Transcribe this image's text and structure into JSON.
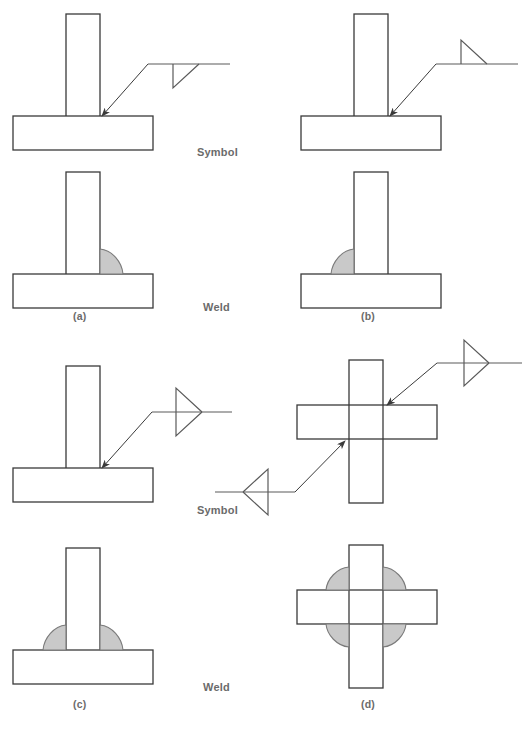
{
  "figure": {
    "colors": {
      "line": "#3a3a3a",
      "symbol_line": "#5a5a5a",
      "weld_fill": "#c9c9c9",
      "weld_stroke": "#7a7a7a",
      "label_text": "#6b6b6b",
      "background": "#ffffff"
    },
    "row_labels": [
      {
        "id": "symbol-top",
        "text": "Symbol"
      },
      {
        "id": "weld-top",
        "text": "Weld"
      },
      {
        "id": "symbol-bottom",
        "text": "Symbol"
      },
      {
        "id": "weld-bottom",
        "text": "Weld"
      }
    ],
    "panels": [
      {
        "id": "a",
        "letter": "(a)",
        "joint": "tee-joint",
        "symbol": {
          "type": "fillet",
          "triangle_position": "below-reference-line",
          "meaning": "arrow side",
          "triangle_count": 1
        },
        "weld": {
          "count": 1,
          "sides": [
            "right"
          ],
          "description": "single fillet weld on arrow side"
        }
      },
      {
        "id": "b",
        "letter": "(b)",
        "joint": "tee-joint",
        "symbol": {
          "type": "fillet",
          "triangle_position": "above-reference-line",
          "meaning": "other side",
          "triangle_count": 1
        },
        "weld": {
          "count": 1,
          "sides": [
            "left"
          ],
          "description": "single fillet weld on other side"
        }
      },
      {
        "id": "c",
        "letter": "(c)",
        "joint": "tee-joint",
        "symbol": {
          "type": "double-fillet",
          "triangle_position": "both-sides-of-reference-line",
          "meaning": "both sides",
          "triangle_count": 2
        },
        "weld": {
          "count": 2,
          "sides": [
            "left",
            "right"
          ],
          "description": "double fillet weld, both sides"
        }
      },
      {
        "id": "d",
        "letter": "(d)",
        "joint": "cruciform-joint",
        "symbol": {
          "type": "double-fillet-pair",
          "triangle_position": "both-sides-of-reference-line",
          "meaning": "both sides, two arrows to opposite corners",
          "triangle_count": 4,
          "arrow_count": 2
        },
        "weld": {
          "count": 4,
          "sides": [
            "upper-left",
            "upper-right",
            "lower-left",
            "lower-right"
          ],
          "description": "four fillet welds at all corners of cruciform"
        }
      }
    ]
  }
}
